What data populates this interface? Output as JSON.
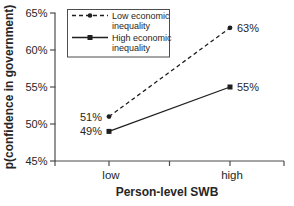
{
  "chart_data": {
    "type": "line",
    "title": "",
    "xlabel": "Person-level SWB",
    "ylabel": "p(confidence in government)",
    "categories": [
      "low",
      "high"
    ],
    "series": [
      {
        "name": "Low economic inequality",
        "values": [
          51,
          63
        ],
        "labels": [
          "51%",
          "63%"
        ],
        "line_style": "dashed",
        "marker": "circle"
      },
      {
        "name": "High economic inequality",
        "values": [
          49,
          55
        ],
        "labels": [
          "49%",
          "55%"
        ],
        "line_style": "solid",
        "marker": "square"
      }
    ],
    "ylim": [
      45,
      65
    ],
    "yticks": [
      45,
      50,
      55,
      60,
      65
    ],
    "ytick_labels": [
      "45%",
      "50%",
      "55%",
      "60%",
      "65%"
    ],
    "grid": false,
    "legend_position": "top-left",
    "legend": [
      {
        "line1": "Low economic",
        "line2": "inequality"
      },
      {
        "line1": "High economic",
        "line2": "inequality"
      }
    ],
    "colors": {
      "background": "#ffffff",
      "axis": "#4d4d4d",
      "text": "#262626",
      "series_line": "#1f1f1f",
      "legend_border": "#4d4d4d"
    }
  }
}
